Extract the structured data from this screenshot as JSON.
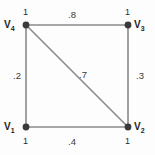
{
  "figure": {
    "type": "weighted-graph",
    "background_color": "#fdfdfd",
    "edge_color": "#8a8a8a",
    "vertex_color": "#3a3a3a",
    "text_color": "#2b2b2b"
  },
  "vertices": [
    {
      "id": "v4",
      "label": "V",
      "subscript": "4",
      "value": "1",
      "position": "top-left"
    },
    {
      "id": "v3",
      "label": "V",
      "subscript": "3",
      "value": "1",
      "position": "top-right"
    },
    {
      "id": "v1",
      "label": "V",
      "subscript": "1",
      "value": "1",
      "position": "bottom-left"
    },
    {
      "id": "v2",
      "label": "V",
      "subscript": "2",
      "value": "1",
      "position": "bottom-right"
    }
  ],
  "edges": [
    {
      "id": "e-top",
      "from": "v4",
      "to": "v3",
      "weight": ".8"
    },
    {
      "id": "e-left",
      "from": "v4",
      "to": "v1",
      "weight": ".2"
    },
    {
      "id": "e-right",
      "from": "v3",
      "to": "v2",
      "weight": ".3"
    },
    {
      "id": "e-bottom",
      "from": "v1",
      "to": "v2",
      "weight": ".4"
    },
    {
      "id": "e-diagonal",
      "from": "v4",
      "to": "v2",
      "weight": ".7"
    }
  ]
}
